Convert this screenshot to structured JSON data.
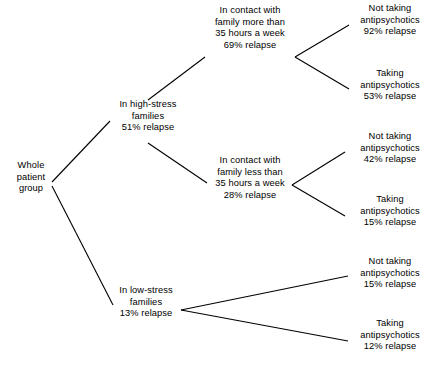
{
  "diagram": {
    "type": "tree",
    "title": "",
    "background_color": "#ffffff",
    "line_color": "#000000",
    "text_color": "#000000",
    "nodes": {
      "root": {
        "lines": [
          "Whole",
          "patient",
          "group"
        ]
      },
      "high_stress": {
        "lines": [
          "In high-stress",
          "families",
          "51% relapse"
        ],
        "relapse": "51%"
      },
      "low_stress": {
        "lines": [
          "In low-stress",
          "families",
          "13% relapse"
        ],
        "relapse": "13%"
      },
      "contact_more": {
        "lines": [
          "In contact with",
          "family more than",
          "35 hours a week",
          "69% relapse"
        ],
        "relapse": "69%"
      },
      "contact_less": {
        "lines": [
          "In contact with",
          "family less than",
          "35 hours a week",
          "28% relapse"
        ],
        "relapse": "28%"
      },
      "leaf_more_not_taking": {
        "lines": [
          "Not taking",
          "antipsychotics",
          "92% relapse"
        ],
        "relapse": "92%"
      },
      "leaf_more_taking": {
        "lines": [
          "Taking",
          "antipsychotics",
          "53% relapse"
        ],
        "relapse": "53%"
      },
      "leaf_less_not_taking": {
        "lines": [
          "Not taking",
          "antipsychotics",
          "42% relapse"
        ],
        "relapse": "42%"
      },
      "leaf_less_taking": {
        "lines": [
          "Taking",
          "antipsychotics",
          "15% relapse"
        ],
        "relapse": "15%"
      },
      "leaf_low_not_taking": {
        "lines": [
          "Not taking",
          "antipsychotics",
          "15% relapse"
        ],
        "relapse": "15%"
      },
      "leaf_low_taking": {
        "lines": [
          "Taking",
          "antipsychotics",
          "12% relapse"
        ],
        "relapse": "12%"
      }
    }
  }
}
